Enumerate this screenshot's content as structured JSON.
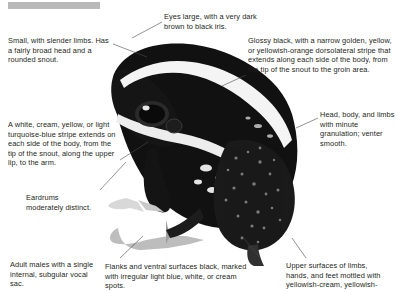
{
  "page": {
    "title_bar": {
      "name": "gray-title-bar",
      "color": "#b9b9b9"
    },
    "background_color": "#ffffff",
    "text_color": "#231f20"
  },
  "figure": {
    "photo_colors": {
      "body": "#121212",
      "stripe": "#f2f2f2",
      "mottle": "#9a9a9a"
    }
  },
  "callouts": [
    {
      "id": "small-slender",
      "name": "callout-small-slender-limbs",
      "text": "Small, with slender limbs. Has a fairly broad head and a rounded snout."
    },
    {
      "id": "eyes",
      "name": "callout-eyes",
      "text": "Eyes large, with a very dark brown to black iris."
    },
    {
      "id": "glossy",
      "name": "callout-glossy-black-dorsolateral-stripe",
      "text": "Glossy black, with a narrow golden, yellow, or yellowish-orange dorsolateral stripe that extends along each side of the body, from the tip of the snout to the groin area."
    },
    {
      "id": "stripe",
      "name": "callout-lateral-stripe",
      "text": "A white, cream, yellow, or light turquoise-blue stripe extends on each side of the body, from the tip of the snout, along the upper lip, to the arm."
    },
    {
      "id": "head-body",
      "name": "callout-head-body-granulation",
      "text": "Head, body, and limbs with minute granulation; venter smooth."
    },
    {
      "id": "eardrums",
      "name": "callout-eardrums",
      "text": "Eardrums moderately distinct."
    },
    {
      "id": "vocal-sac",
      "name": "callout-vocal-sac",
      "text": "Adult males with a single internal, subgular vocal sac."
    },
    {
      "id": "flanks",
      "name": "callout-flanks-ventral-surfaces",
      "text": "Flanks and ventral surfaces black, marked with irregular light blue, white, or cream spots."
    },
    {
      "id": "upper-surfaces",
      "name": "callout-upper-surfaces-limbs",
      "text": "Upper surfaces of limbs, hands, and feet mottled with yellowish-cream, yellowish-"
    }
  ]
}
